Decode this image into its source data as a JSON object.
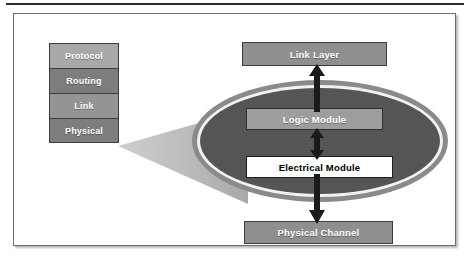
{
  "figure": {
    "colors": {
      "ellipse_fill": "#555555",
      "ellipse_ring": "#f2f2f2",
      "ellipse_outer": "#8a8a8a",
      "box_gray": "#8f8f8f",
      "box_white": "#ffffff",
      "cone": "#b4b4b4",
      "frame_border": "#6e6e6e",
      "arrow": "#1a1a1a"
    }
  },
  "stack": {
    "name": "protocol-stack",
    "layers": [
      {
        "label": "Protocol",
        "tone": "light"
      },
      {
        "label": "Routing",
        "tone": "dark"
      },
      {
        "label": "Link",
        "tone": "mid"
      },
      {
        "label": "Physical",
        "tone": "dark"
      }
    ]
  },
  "flow": {
    "link_layer": "Link Layer",
    "logic_module": "Logic Module",
    "electrical_module": "Electrical Module",
    "physical_channel": "Physical Channel"
  },
  "connectors": [
    {
      "name": "logic-to-link-layer",
      "direction": "up"
    },
    {
      "name": "logic-to-electrical",
      "direction": "bidirectional"
    },
    {
      "name": "electrical-to-physical-channel",
      "direction": "down"
    },
    {
      "name": "physical-layer-zoom-cone",
      "direction": "expand"
    }
  ]
}
